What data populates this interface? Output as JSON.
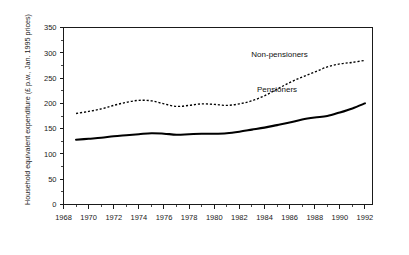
{
  "chart_data": {
    "type": "line",
    "title": "",
    "xlabel": "",
    "ylabel": "Household equivalent expenditure (£ p.w., Jan. 1995 prices)",
    "xlim": [
      1968,
      1992.6
    ],
    "ylim": [
      0,
      350
    ],
    "grid": false,
    "legend_position": "inline-annotation",
    "y_ticks": [
      0,
      50,
      100,
      150,
      200,
      250,
      300,
      350
    ],
    "y_tick_labels": [
      "0",
      "50",
      "100",
      "150",
      "200",
      "250",
      "300",
      "350"
    ],
    "x_ticks": [
      1968,
      1970,
      1972,
      1974,
      1976,
      1978,
      1980,
      1982,
      1984,
      1986,
      1988,
      1990,
      1992
    ],
    "x_tick_labels": [
      "1968",
      "1970",
      "1972",
      "1974",
      "1976",
      "1978",
      "1980",
      "1982",
      "1984",
      "1986",
      "1988",
      "1990",
      "1992"
    ],
    "x_minor_ticks": [
      1969,
      1971,
      1973,
      1975,
      1977,
      1979,
      1981,
      1983,
      1985,
      1987,
      1989,
      1991
    ],
    "x": [
      1969,
      1970,
      1971,
      1972,
      1973,
      1974,
      1975,
      1976,
      1977,
      1978,
      1979,
      1980,
      1981,
      1982,
      1983,
      1984,
      1985,
      1986,
      1987,
      1988,
      1989,
      1990,
      1991,
      1992
    ],
    "series": [
      {
        "name": "Non-pensioners",
        "style": "dashed",
        "values": [
          180,
          184,
          189,
          196,
          202,
          206,
          205,
          199,
          194,
          196,
          199,
          198,
          196,
          199,
          205,
          215,
          228,
          241,
          252,
          262,
          272,
          278,
          281,
          285
        ],
        "annotation": {
          "text": "Non-pensioners",
          "x_year": 1985.2,
          "y_value": 292
        }
      },
      {
        "name": "Pensioners",
        "style": "solid",
        "values": [
          128,
          130,
          132,
          135,
          137,
          139,
          141,
          140,
          138,
          139,
          140,
          140,
          141,
          144,
          148,
          152,
          157,
          162,
          168,
          172,
          175,
          182,
          190,
          200
        ],
        "annotation": {
          "text": "Pensioners",
          "x_year": 1985.0,
          "y_value": 222
        }
      }
    ]
  },
  "figure": {
    "background_color": "#ffffff",
    "axis_color": "#1a1a1a",
    "series_color": "#000000"
  }
}
